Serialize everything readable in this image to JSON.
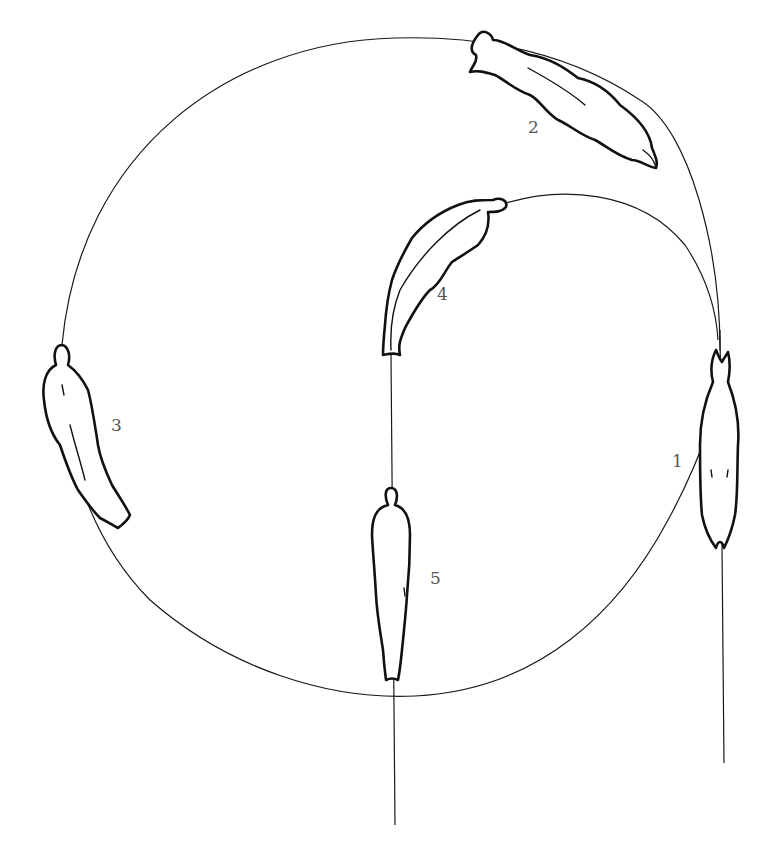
{
  "diagram": {
    "type": "motion-path illustration",
    "stroke_color": "#111111",
    "background": "#ffffff",
    "positions": [
      {
        "label": "1",
        "orientation": "vertical, head down"
      },
      {
        "label": "2",
        "orientation": "diagonal, head lower-right"
      },
      {
        "label": "3",
        "orientation": "vertical-diagonal, head up"
      },
      {
        "label": "4",
        "orientation": "curved, head upper-right"
      },
      {
        "label": "5",
        "orientation": "vertical, head up"
      }
    ]
  }
}
